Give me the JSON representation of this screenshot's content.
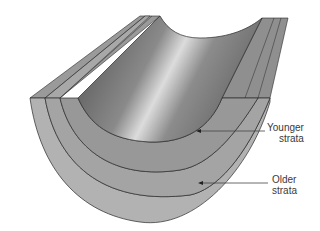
{
  "diagram": {
    "labels": {
      "younger": {
        "line1": "Younger",
        "line2": "strata"
      },
      "older": {
        "line1": "Older",
        "line2": "strata"
      }
    },
    "colors": {
      "top_surface_light": "#d8d8d8",
      "top_surface_dark": "#5a5a5a",
      "layer_inner": "#9a9a9a",
      "layer_middle": "#a6a6a6",
      "layer_outer": "#b2b2b2",
      "outline": "#2a2a2a",
      "leader": "#444444"
    }
  }
}
